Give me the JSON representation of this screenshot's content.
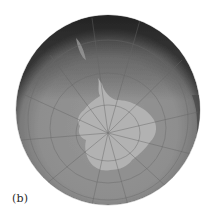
{
  "figure": {
    "panel_label": "(b)",
    "colors": {
      "background": "#ffffff",
      "ocean": "#8f8f8f",
      "ocean_edge_dark": "#3a3a3a",
      "land": "#b4b4b4",
      "graticule": "#6c6c6c"
    },
    "globe": {
      "center_x": 108,
      "center_y": 110,
      "radius": 93,
      "pole_x": 108,
      "pole_y": 133
    }
  }
}
